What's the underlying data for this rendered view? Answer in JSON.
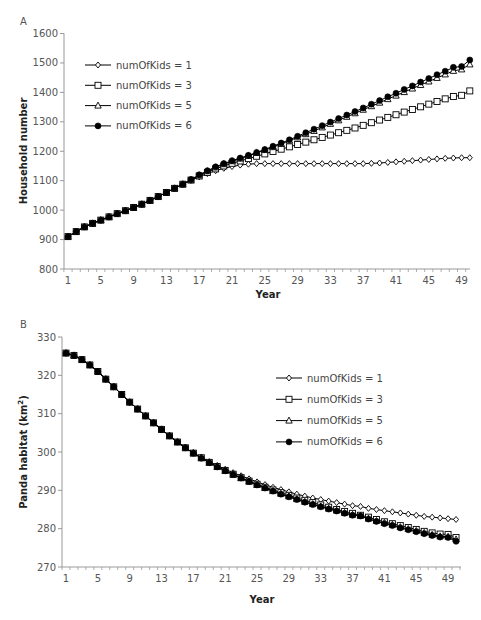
{
  "chart_data": [
    {
      "panel": "A",
      "type": "line",
      "title": "",
      "xlabel": "Year",
      "ylabel": "Household number",
      "ylim": [
        800,
        1600
      ],
      "yticks": [
        800,
        900,
        1000,
        1100,
        1200,
        1300,
        1400,
        1500,
        1600
      ],
      "xticks": [
        1,
        5,
        9,
        13,
        17,
        21,
        25,
        29,
        33,
        37,
        41,
        45,
        49
      ],
      "x": [
        1,
        2,
        3,
        4,
        5,
        6,
        7,
        8,
        9,
        10,
        11,
        12,
        13,
        14,
        15,
        16,
        17,
        18,
        19,
        20,
        21,
        22,
        23,
        24,
        25,
        26,
        27,
        28,
        29,
        30,
        31,
        32,
        33,
        34,
        35,
        36,
        37,
        38,
        39,
        40,
        41,
        42,
        43,
        44,
        45,
        46,
        47,
        48,
        49,
        50
      ],
      "grid": false,
      "legend_position": "upper-left",
      "series": [
        {
          "name": "numOfKids = 1",
          "marker": "diamond",
          "values": [
            910,
            927,
            943,
            955,
            966,
            977,
            988,
            998,
            1009,
            1020,
            1033,
            1046,
            1060,
            1074,
            1088,
            1101,
            1113,
            1124,
            1134,
            1142,
            1148,
            1153,
            1156,
            1158,
            1158,
            1158,
            1158,
            1158,
            1158,
            1158,
            1158,
            1158,
            1158,
            1158,
            1158,
            1158,
            1158,
            1159,
            1160,
            1162,
            1164,
            1166,
            1168,
            1170,
            1172,
            1174,
            1176,
            1177,
            1178,
            1178
          ]
        },
        {
          "name": "numOfKids = 3",
          "marker": "square",
          "values": [
            910,
            927,
            943,
            955,
            966,
            977,
            988,
            998,
            1009,
            1020,
            1033,
            1046,
            1060,
            1074,
            1088,
            1102,
            1116,
            1128,
            1140,
            1150,
            1159,
            1167,
            1175,
            1183,
            1191,
            1199,
            1207,
            1215,
            1223,
            1231,
            1239,
            1247,
            1255,
            1263,
            1271,
            1279,
            1288,
            1297,
            1306,
            1315,
            1324,
            1333,
            1342,
            1351,
            1360,
            1369,
            1378,
            1386,
            1390,
            1405
          ]
        },
        {
          "name": "numOfKids = 5",
          "marker": "triangle",
          "values": [
            910,
            927,
            943,
            955,
            966,
            977,
            988,
            998,
            1009,
            1020,
            1033,
            1046,
            1060,
            1074,
            1088,
            1103,
            1118,
            1132,
            1145,
            1156,
            1166,
            1175,
            1184,
            1194,
            1204,
            1214,
            1225,
            1236,
            1247,
            1258,
            1269,
            1281,
            1293,
            1305,
            1317,
            1329,
            1341,
            1353,
            1365,
            1377,
            1389,
            1401,
            1413,
            1425,
            1437,
            1449,
            1461,
            1473,
            1478,
            1495
          ]
        },
        {
          "name": "numOfKids = 6",
          "marker": "circle-filled",
          "values": [
            910,
            927,
            943,
            955,
            966,
            977,
            988,
            998,
            1009,
            1020,
            1033,
            1046,
            1060,
            1074,
            1088,
            1104,
            1120,
            1134,
            1147,
            1158,
            1168,
            1177,
            1186,
            1196,
            1206,
            1217,
            1228,
            1239,
            1251,
            1263,
            1275,
            1287,
            1299,
            1311,
            1323,
            1335,
            1347,
            1360,
            1372,
            1385,
            1397,
            1410,
            1422,
            1435,
            1447,
            1460,
            1472,
            1485,
            1488,
            1510
          ]
        }
      ]
    },
    {
      "panel": "B",
      "type": "line",
      "title": "",
      "xlabel": "Year",
      "ylabel": "Panda habitat (km²)",
      "ylim": [
        270,
        330
      ],
      "yticks": [
        270,
        280,
        290,
        300,
        310,
        320,
        330
      ],
      "xticks": [
        1,
        5,
        9,
        13,
        17,
        21,
        25,
        29,
        33,
        37,
        41,
        45,
        49
      ],
      "x": [
        1,
        2,
        3,
        4,
        5,
        6,
        7,
        8,
        9,
        10,
        11,
        12,
        13,
        14,
        15,
        16,
        17,
        18,
        19,
        20,
        21,
        22,
        23,
        24,
        25,
        26,
        27,
        28,
        29,
        30,
        31,
        32,
        33,
        34,
        35,
        36,
        37,
        38,
        39,
        40,
        41,
        42,
        43,
        44,
        45,
        46,
        47,
        48,
        49,
        50
      ],
      "grid": false,
      "legend_position": "upper-right",
      "series": [
        {
          "name": "numOfKids = 1",
          "marker": "diamond",
          "values": [
            325.8,
            325.2,
            324.1,
            322.7,
            321.0,
            319.0,
            317.0,
            315.0,
            313.0,
            311.2,
            309.4,
            307.6,
            305.9,
            304.2,
            302.6,
            301.1,
            299.8,
            298.7,
            297.5,
            296.5,
            295.5,
            294.6,
            293.8,
            293.0,
            292.2,
            291.5,
            290.8,
            290.2,
            289.6,
            289.0,
            288.5,
            288.0,
            287.6,
            287.2,
            286.8,
            286.4,
            286.0,
            285.8,
            285.3,
            285.0,
            284.7,
            284.4,
            284.1,
            283.8,
            283.5,
            283.2,
            283.0,
            282.8,
            282.6,
            282.4
          ]
        },
        {
          "name": "numOfKids = 3",
          "marker": "square",
          "values": [
            325.8,
            325.2,
            324.1,
            322.7,
            321.0,
            319.0,
            317.0,
            315.0,
            313.0,
            311.2,
            309.4,
            307.6,
            305.9,
            304.2,
            302.6,
            301.1,
            299.7,
            298.5,
            297.3,
            296.2,
            295.2,
            294.2,
            293.3,
            292.4,
            291.6,
            290.8,
            290.1,
            289.4,
            288.7,
            288.0,
            287.4,
            286.8,
            286.2,
            285.6,
            285.0,
            284.5,
            284.0,
            283.5,
            283.0,
            282.4,
            281.8,
            281.3,
            280.8,
            280.3,
            279.8,
            279.3,
            278.9,
            278.6,
            278.5,
            277.7
          ]
        },
        {
          "name": "numOfKids = 5",
          "marker": "triangle",
          "values": [
            325.8,
            325.2,
            324.1,
            322.7,
            321.0,
            319.0,
            317.0,
            315.0,
            313.0,
            311.2,
            309.4,
            307.6,
            305.9,
            304.2,
            302.6,
            301.1,
            299.7,
            298.4,
            297.2,
            296.1,
            295.1,
            294.1,
            293.2,
            292.3,
            291.4,
            290.6,
            289.8,
            289.1,
            288.4,
            287.7,
            287.0,
            286.4,
            285.8,
            285.2,
            284.7,
            284.1,
            283.6,
            283.4,
            282.6,
            282.0,
            281.5,
            281.0,
            280.4,
            279.9,
            279.4,
            278.9,
            278.4,
            278.0,
            277.9,
            277.2
          ]
        },
        {
          "name": "numOfKids = 6",
          "marker": "circle-filled",
          "values": [
            325.8,
            325.2,
            324.1,
            322.7,
            321.0,
            319.0,
            317.0,
            315.0,
            313.0,
            311.2,
            309.4,
            307.6,
            305.9,
            304.2,
            302.6,
            301.1,
            299.7,
            298.4,
            297.2,
            296.1,
            295.1,
            294.1,
            293.2,
            292.3,
            291.4,
            290.6,
            289.8,
            289.0,
            288.3,
            287.6,
            286.9,
            286.3,
            285.7,
            285.1,
            284.6,
            284.0,
            283.5,
            283.3,
            282.5,
            281.9,
            281.3,
            280.8,
            280.2,
            279.7,
            279.2,
            278.7,
            278.2,
            277.8,
            277.7,
            276.7
          ]
        }
      ]
    }
  ],
  "panels": {
    "a": {
      "label": "A",
      "xlabel": "Year",
      "ylabel": "Household number"
    },
    "b": {
      "label": "B",
      "xlabel": "Year",
      "ylabel_main": "Panda habitat (km",
      "ylabel_sup": "2",
      "ylabel_close": ")"
    }
  },
  "colors": {
    "series": "#000000",
    "axis": "#999999",
    "tick_text": "#555555",
    "label_text": "#222222"
  }
}
